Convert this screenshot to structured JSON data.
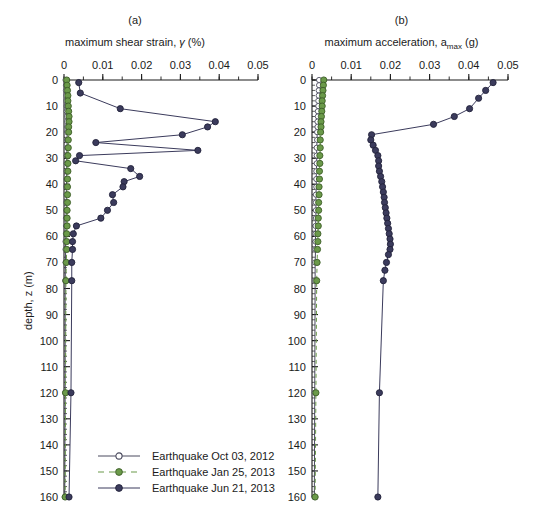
{
  "figure": {
    "panel_a_label": "(a)",
    "panel_b_label": "(b)",
    "ylabel": "depth, z (m)",
    "xlabel_a_pre": "maximum shear strain, ",
    "xlabel_a_sym": "γ",
    "xlabel_a_post": " (%)",
    "xlabel_b_pre": "maximum acceleration, a",
    "xlabel_b_sub": "max",
    "xlabel_b_post": " (g)"
  },
  "colors": {
    "series1": "#4a4a5e",
    "series2": "#6b9a4a",
    "series3": "#3b3b5c",
    "axis": "#1a1a1a",
    "background": "#ffffff"
  },
  "legend": {
    "items": [
      {
        "label": "Earthquake Oct 03, 2012",
        "marker": "open-circle",
        "line": "solid",
        "color": "#4a4a5e"
      },
      {
        "label": "Earthquake Jan 25, 2013",
        "marker": "filled-circle",
        "line": "dashed",
        "color": "#6b9a4a"
      },
      {
        "label": "Earthquake Jun 21, 2013",
        "marker": "filled-circle",
        "line": "solid",
        "color": "#3b3b5c"
      }
    ]
  },
  "chart_data": [
    {
      "type": "line",
      "title": "(a)",
      "xlabel": "maximum shear strain, γ (%)",
      "ylabel": "depth, z (m)",
      "xlim": [
        0,
        0.05
      ],
      "ylim": [
        0,
        160
      ],
      "y_inverted": true,
      "xticks": [
        0,
        0.01,
        0.02,
        0.03,
        0.04,
        0.05
      ],
      "xtick_labels": [
        "0",
        "0.01",
        "0.02",
        "0.03",
        "0.04",
        "0.05"
      ],
      "xminor_step": 0.005,
      "yticks": [
        0,
        10,
        20,
        30,
        40,
        50,
        60,
        70,
        80,
        90,
        100,
        110,
        120,
        130,
        140,
        150,
        160
      ],
      "ytick_labels": [
        "0",
        "10",
        "20",
        "30",
        "40",
        "50",
        "60",
        "70",
        "80",
        "90",
        "100",
        "110",
        "120",
        "130",
        "140",
        "150",
        "160"
      ],
      "yminor_step": 2,
      "grid": false,
      "legend_position": "bottom-left",
      "series": [
        {
          "name": "Earthquake Oct 03, 2012",
          "color": "#4a4a5e",
          "marker": "open-circle",
          "line": "solid",
          "depths": [
            0,
            2,
            4,
            6,
            8,
            10,
            12,
            14,
            16,
            18,
            20,
            23,
            26,
            29,
            32,
            35,
            38,
            41,
            44,
            47,
            50,
            53,
            56,
            59,
            62,
            65,
            70,
            77,
            120,
            160
          ],
          "values": [
            0.0004,
            0.0005,
            0.0005,
            0.0006,
            0.0006,
            0.0007,
            0.0007,
            0.0008,
            0.0008,
            0.0008,
            0.0008,
            0.0008,
            0.0008,
            0.0007,
            0.0007,
            0.0007,
            0.0007,
            0.0006,
            0.0006,
            0.0006,
            0.0006,
            0.0005,
            0.0005,
            0.0005,
            0.0004,
            0.0004,
            0.0004,
            0.0003,
            0.0003,
            0.0002
          ]
        },
        {
          "name": "Earthquake Jan 25, 2013",
          "color": "#6b9a4a",
          "marker": "filled-circle",
          "line": "dashed",
          "depths": [
            0,
            2,
            4,
            6,
            8,
            10,
            12,
            14,
            16,
            18,
            20,
            23,
            26,
            29,
            32,
            35,
            38,
            41,
            44,
            47,
            50,
            53,
            56,
            59,
            62,
            65,
            70,
            77,
            120,
            160
          ],
          "values": [
            0.0007,
            0.0008,
            0.0009,
            0.001,
            0.001,
            0.0011,
            0.0012,
            0.0013,
            0.0013,
            0.0012,
            0.0012,
            0.0011,
            0.0011,
            0.001,
            0.001,
            0.001,
            0.0009,
            0.0009,
            0.0009,
            0.0009,
            0.0008,
            0.0008,
            0.0008,
            0.0007,
            0.0007,
            0.0007,
            0.0006,
            0.0005,
            0.0004,
            0.0003
          ]
        },
        {
          "name": "Earthquake Jun 21, 2013",
          "color": "#3b3b5c",
          "marker": "filled-circle",
          "line": "solid",
          "depths": [
            1,
            5,
            11,
            16,
            18,
            21,
            24,
            27,
            29,
            31,
            34,
            37,
            39,
            41,
            44,
            47,
            50,
            53,
            56,
            59,
            62,
            65,
            70,
            77,
            120,
            160
          ],
          "values": [
            0.0038,
            0.0042,
            0.0145,
            0.039,
            0.037,
            0.0305,
            0.0082,
            0.0345,
            0.004,
            0.003,
            0.0172,
            0.0195,
            0.0155,
            0.0152,
            0.0125,
            0.0128,
            0.0112,
            0.0095,
            0.0032,
            0.0024,
            0.0022,
            0.0022,
            0.002,
            0.002,
            0.0018,
            0.0013
          ]
        }
      ]
    },
    {
      "type": "line",
      "title": "(b)",
      "xlabel": "maximum acceleration, a_max (g)",
      "ylabel": "depth, z (m)",
      "xlim": [
        0,
        0.05
      ],
      "ylim": [
        0,
        160
      ],
      "y_inverted": true,
      "xticks": [
        0,
        0.01,
        0.02,
        0.03,
        0.04,
        0.05
      ],
      "xtick_labels": [
        "0",
        "0.01",
        "0.02",
        "0.03",
        "0.04",
        "0.05"
      ],
      "xminor_step": 0.005,
      "yticks": [
        0,
        10,
        20,
        30,
        40,
        50,
        60,
        70,
        80,
        90,
        100,
        110,
        120,
        130,
        140,
        150,
        160
      ],
      "ytick_labels": [
        "0",
        "10",
        "20",
        "30",
        "40",
        "50",
        "60",
        "70",
        "80",
        "90",
        "100",
        "110",
        "120",
        "130",
        "140",
        "150",
        "160"
      ],
      "yminor_step": 2,
      "grid": false,
      "legend_position": "none",
      "series": [
        {
          "name": "Earthquake Oct 03, 2012",
          "color": "#4a4a5e",
          "marker": "open-circle",
          "line": "solid",
          "depths": [
            0,
            2,
            4,
            6,
            8,
            10,
            12,
            14,
            16,
            18,
            20,
            23,
            26,
            29,
            32,
            35,
            38,
            41,
            44,
            47,
            50,
            53,
            56,
            59,
            62,
            65,
            70,
            77,
            120,
            160
          ],
          "values": [
            0.0018,
            0.0018,
            0.0017,
            0.0017,
            0.0016,
            0.0016,
            0.0015,
            0.0015,
            0.0014,
            0.0014,
            0.0013,
            0.0013,
            0.0012,
            0.0012,
            0.0012,
            0.0011,
            0.0011,
            0.0011,
            0.001,
            0.001,
            0.001,
            0.001,
            0.0009,
            0.0009,
            0.0009,
            0.0009,
            0.0008,
            0.0008,
            0.0007,
            0.0006
          ]
        },
        {
          "name": "Earthquake Jan 25, 2013",
          "color": "#6b9a4a",
          "marker": "filled-circle",
          "line": "dashed",
          "depths": [
            0,
            2,
            4,
            6,
            8,
            10,
            12,
            14,
            16,
            18,
            20,
            23,
            26,
            29,
            32,
            35,
            38,
            41,
            44,
            47,
            50,
            53,
            56,
            59,
            62,
            65,
            70,
            77,
            120,
            160
          ],
          "values": [
            0.003,
            0.0029,
            0.0028,
            0.0027,
            0.0026,
            0.0026,
            0.0025,
            0.0024,
            0.0023,
            0.0023,
            0.0022,
            0.0021,
            0.0021,
            0.002,
            0.002,
            0.0019,
            0.0019,
            0.0018,
            0.0018,
            0.0017,
            0.0017,
            0.0016,
            0.0016,
            0.0015,
            0.0015,
            0.0014,
            0.0013,
            0.0012,
            0.001,
            0.0008
          ]
        },
        {
          "name": "Earthquake Jun 21, 2013",
          "color": "#3b3b5c",
          "marker": "filled-circle",
          "line": "solid",
          "depths": [
            1,
            4,
            7,
            11,
            14,
            17,
            21,
            23,
            25,
            27,
            29,
            31,
            33,
            35,
            37,
            39,
            41,
            43,
            45,
            47,
            49,
            51,
            53,
            55,
            57,
            59,
            61,
            63,
            65,
            67,
            70,
            73,
            77,
            120,
            160
          ],
          "values": [
            0.0462,
            0.0443,
            0.0425,
            0.0402,
            0.0363,
            0.031,
            0.0152,
            0.015,
            0.0156,
            0.0162,
            0.0168,
            0.017,
            0.017,
            0.0172,
            0.0175,
            0.0178,
            0.018,
            0.0182,
            0.0184,
            0.0185,
            0.0187,
            0.0189,
            0.0191,
            0.0193,
            0.0195,
            0.0197,
            0.0199,
            0.02,
            0.0199,
            0.0195,
            0.019,
            0.0186,
            0.0182,
            0.0172,
            0.0168
          ]
        }
      ]
    }
  ]
}
